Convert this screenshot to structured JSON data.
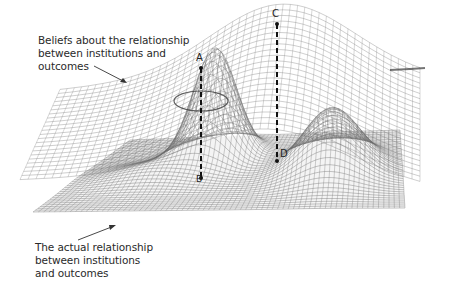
{
  "diagram": {
    "type": "3d-surface-comparison",
    "surfaces": [
      {
        "id": "beliefs",
        "label_lines": [
          "Beliefs about the relationship",
          "between institutions and",
          "outcomes"
        ],
        "description": "Upper smooth, broadly curved wireframe surface"
      },
      {
        "id": "actual",
        "label_lines": [
          "The actual relationship",
          "between institutions",
          "and outcomes"
        ],
        "description": "Lower flat wireframe plane with a tall peak and a second rounded hump"
      }
    ],
    "points": {
      "A": "A",
      "B": "B",
      "C": "C",
      "D": "D"
    },
    "connections": [
      {
        "from": "A",
        "to": "B",
        "style": "dashed"
      },
      {
        "from": "C",
        "to": "D",
        "style": "dashed"
      }
    ],
    "colors": {
      "mesh": "#6a6a6a",
      "mesh_dark": "#3a3a3a",
      "text": "#2a2a2a",
      "background": "#ffffff"
    }
  }
}
